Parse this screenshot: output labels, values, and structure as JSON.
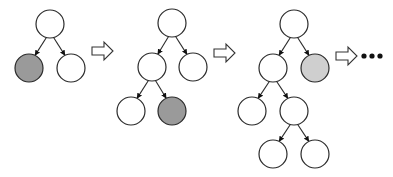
{
  "diagram": {
    "colors": {
      "node_fill": "#ffffff",
      "highlight_dark": "#9a9a9a",
      "highlight_light": "#cfcfcf",
      "stroke": "#2a2a2a"
    },
    "trees": [
      {
        "name": "tree-step-1",
        "nodes": [
          {
            "id": "root",
            "highlight": "none"
          },
          {
            "id": "L",
            "parent": "root",
            "highlight": "dark"
          },
          {
            "id": "R",
            "parent": "root",
            "highlight": "none"
          }
        ]
      },
      {
        "name": "tree-step-2",
        "nodes": [
          {
            "id": "root",
            "highlight": "none"
          },
          {
            "id": "L",
            "parent": "root",
            "highlight": "none"
          },
          {
            "id": "R",
            "parent": "root",
            "highlight": "none"
          },
          {
            "id": "LL",
            "parent": "L",
            "highlight": "none"
          },
          {
            "id": "LR",
            "parent": "L",
            "highlight": "dark"
          }
        ]
      },
      {
        "name": "tree-step-3",
        "nodes": [
          {
            "id": "root",
            "highlight": "none"
          },
          {
            "id": "L",
            "parent": "root",
            "highlight": "none"
          },
          {
            "id": "R",
            "parent": "root",
            "highlight": "light"
          },
          {
            "id": "LL",
            "parent": "L",
            "highlight": "none"
          },
          {
            "id": "LR",
            "parent": "L",
            "highlight": "none"
          },
          {
            "id": "LRL",
            "parent": "LR",
            "highlight": "none"
          },
          {
            "id": "LRR",
            "parent": "LR",
            "highlight": "none"
          }
        ]
      }
    ],
    "transitions": [
      "arrow",
      "arrow",
      "arrow"
    ],
    "continuation": "ellipsis"
  }
}
